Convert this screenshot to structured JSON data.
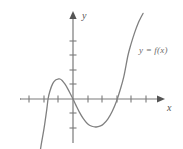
{
  "figure": {
    "name": "function-graph",
    "width": 183,
    "height": 149,
    "background_color": "#ffffff"
  },
  "labels": {
    "x_axis": "x",
    "y_axis": "y",
    "curve": "y = f(x)"
  },
  "colors": {
    "axis": "#7a7a7a",
    "curve": "#808080",
    "tick": "#7a7a7a",
    "label": "#555555",
    "curve_label": "#6a6a6a"
  },
  "chart_data": {
    "type": "line",
    "title": "",
    "xlabel": "x",
    "ylabel": "y",
    "legend": [
      "y = f(x)"
    ],
    "legend_position": "inside-right",
    "grid": false,
    "axis_style": "arrows-both-ends",
    "xlim": [
      -3.7,
      6.0
    ],
    "ylim": [
      -5.9,
      5.9
    ],
    "x_ticks": [
      -3,
      -2,
      -1,
      1,
      2,
      3,
      4,
      5
    ],
    "y_ticks": [
      -4,
      -3,
      -2,
      -1,
      1,
      2,
      3,
      4,
      5
    ],
    "tick_labels_shown": false,
    "origin_px": [
      73,
      99
    ],
    "unit_px": 14.5,
    "x_intercepts": [
      -1.72,
      0.0,
      3.79
    ],
    "local_maximum": {
      "x": -0.9,
      "y": 1.38
    },
    "local_minimum": {
      "x": 2.4,
      "y": -1.93
    },
    "series": [
      {
        "name": "y = f(x)",
        "x": [
          -2.55,
          -2.4,
          -2.2,
          -2.0,
          -1.8,
          -1.72,
          -1.6,
          -1.4,
          -1.2,
          -1.0,
          -0.9,
          -0.75,
          -0.55,
          -0.35,
          -0.15,
          0.0,
          0.2,
          0.45,
          0.7,
          1.0,
          1.3,
          1.6,
          1.9,
          2.1,
          2.4,
          2.7,
          3.0,
          3.25,
          3.5,
          3.79,
          4.0,
          4.25,
          4.5,
          4.7,
          4.83
        ],
        "y": [
          -5.9,
          -4.55,
          -3.2,
          -2.05,
          -0.65,
          0.0,
          0.52,
          1.06,
          1.31,
          1.38,
          1.38,
          1.28,
          1.02,
          0.68,
          0.29,
          0.0,
          -0.42,
          -0.92,
          -1.33,
          -1.7,
          -1.88,
          -1.93,
          -1.85,
          -1.72,
          -1.38,
          -0.86,
          -0.15,
          0.62,
          1.52,
          3.0,
          3.78,
          4.58,
          5.25,
          5.65,
          5.9
        ]
      }
    ]
  },
  "geometry": {
    "x_axis": {
      "x1": 20,
      "x2": 160,
      "y": 99
    },
    "y_axis": {
      "x": 73,
      "y1": 14,
      "y2": 143
    },
    "x_tick_px": [
      29,
      44,
      58,
      88,
      102,
      117,
      131,
      146
    ],
    "y_tick_px": [
      41,
      55,
      70,
      84,
      113,
      128
    ],
    "tick_half_len": 3.5,
    "curve_path": "M 36.0,148.5 L 38.0,142.0 C 40.5,133.5 43.5,124.0 46.0,115.0 C 47.6,109.4 48.5,104.6 49.0,99.0 C 50.3,93.6 51.8,89.0 54.0,85.2 C 56.0,81.7 58.0,79.4 60.0,79.0 C 62.2,78.6 64.2,80.2 66.0,83.2 C 68.4,87.2 70.6,92.8 73.0,99.0 C 75.4,105.3 78.0,111.4 81.0,116.6 C 84.3,122.3 88.0,126.0 92.0,127.8 C 96.5,129.8 101.5,130.0 106.0,128.6 C 110.0,127.3 113.4,124.4 116.4,120.0 C 119.8,115.0 122.4,108.5 124.8,101.0 C 126.0,97.2 126.8,95.0 128.0,91.0 C 130.5,82.5 133.0,70.0 136.0,55.0 C 138.5,42.5 140.8,30.0 142.8,16.0 L 143.4,12.0"
  }
}
